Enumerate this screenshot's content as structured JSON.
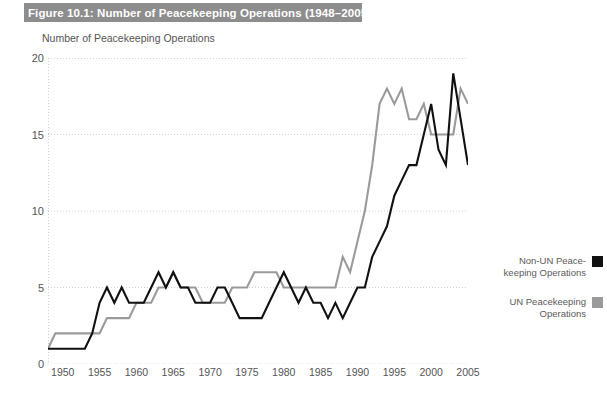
{
  "figure": {
    "title": "Figure 10.1: Number of Peacekeeping Operations (1948–2005)",
    "title_band_color": "#8d8d8d",
    "title_text_color": "#ffffff"
  },
  "axis_caption": "Number of Peacekeeping Operations",
  "legend": {
    "items": [
      {
        "label": "Non-UN Peace-keeping Operations",
        "color": "#111111",
        "swatch_name": "legend-swatch-non-un"
      },
      {
        "label": "UN Peacekeeping Operations",
        "color": "#9a9a9a",
        "swatch_name": "legend-swatch-un"
      }
    ]
  },
  "chart_data": {
    "type": "line",
    "title": "Figure 10.1: Number of Peacekeeping Operations (1948–2005)",
    "xlabel": "",
    "ylabel": "Number of Peacekeeping Operations",
    "xlim": [
      1948,
      2005
    ],
    "ylim": [
      0,
      20
    ],
    "yticks": [
      0,
      5,
      10,
      15,
      20
    ],
    "xticks": [
      1950,
      1955,
      1960,
      1965,
      1970,
      1975,
      1980,
      1985,
      1990,
      1995,
      2000,
      2005
    ],
    "grid": true,
    "grid_style": "dotted-horizontal",
    "legend_position": "right",
    "x": [
      1948,
      1949,
      1950,
      1951,
      1952,
      1953,
      1954,
      1955,
      1956,
      1957,
      1958,
      1959,
      1960,
      1961,
      1962,
      1963,
      1964,
      1965,
      1966,
      1967,
      1968,
      1969,
      1970,
      1971,
      1972,
      1973,
      1974,
      1975,
      1976,
      1977,
      1978,
      1979,
      1980,
      1981,
      1982,
      1983,
      1984,
      1985,
      1986,
      1987,
      1988,
      1989,
      1990,
      1991,
      1992,
      1993,
      1994,
      1995,
      1996,
      1997,
      1998,
      1999,
      2000,
      2001,
      2002,
      2003,
      2004,
      2005
    ],
    "series": [
      {
        "name": "Non-UN Peacekeeping Operations",
        "color": "#111111",
        "values": [
          1,
          1,
          1,
          1,
          1,
          1,
          2,
          4,
          5,
          4,
          5,
          4,
          4,
          4,
          5,
          6,
          5,
          6,
          5,
          5,
          4,
          4,
          4,
          5,
          5,
          4,
          3,
          3,
          3,
          3,
          4,
          5,
          6,
          5,
          4,
          5,
          4,
          4,
          3,
          4,
          3,
          4,
          5,
          5,
          7,
          8,
          9,
          11,
          12,
          13,
          13,
          15,
          17,
          14,
          13,
          19,
          16,
          13
        ]
      },
      {
        "name": "UN Peacekeeping Operations",
        "color": "#9a9a9a",
        "values": [
          1,
          2,
          2,
          2,
          2,
          2,
          2,
          2,
          3,
          3,
          3,
          3,
          4,
          4,
          4,
          5,
          5,
          6,
          5,
          5,
          5,
          4,
          4,
          4,
          4,
          5,
          5,
          5,
          6,
          6,
          6,
          6,
          5,
          5,
          5,
          5,
          5,
          5,
          5,
          5,
          7,
          6,
          8,
          10,
          13,
          17,
          18,
          17,
          18,
          16,
          16,
          17,
          15,
          15,
          15,
          15,
          18,
          17
        ]
      }
    ]
  }
}
